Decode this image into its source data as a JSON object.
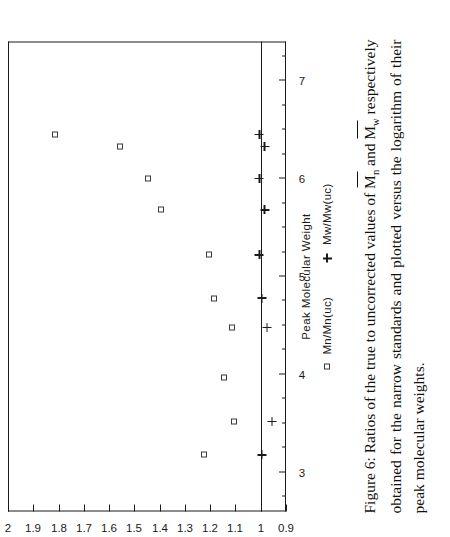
{
  "figure": {
    "caption_prefix": "Figure 6:",
    "caption_text": " Ratios of the true to uncorrected values of M̄n and M̄w respectively obtained for the narrow standards and plotted versus the logarithm of their peak molecular weights.",
    "caption_part1": " Ratios of the true to uncorrected values of ",
    "caption_m1_base": "M",
    "caption_m1_sub": "n",
    "caption_mid1": " and ",
    "caption_m2_base": "M",
    "caption_m2_sub": "w",
    "caption_part2": " respectively obtained for the narrow standards and plotted versus the logarithm of their peak molecular weights."
  },
  "chart_data": {
    "type": "scatter",
    "title": "",
    "xlabel": "Peak Molecular Weight",
    "ylabel": "",
    "xlim": [
      2.6,
      7.4
    ],
    "ylim": [
      0.9,
      2.0
    ],
    "grid": false,
    "legend_position": "below",
    "legend_title": "Peak Molecular Weight",
    "x_ticks_major": [
      3,
      4,
      5,
      6,
      7
    ],
    "x_ticks_major_labels": [
      "3",
      "4",
      "5",
      "6",
      "7"
    ],
    "x_ticks_minor": [
      2.75,
      3.25,
      3.5,
      3.75,
      4.25,
      4.5,
      4.75,
      5.25,
      5.5,
      5.75,
      6.25,
      6.5,
      6.75,
      7.25
    ],
    "y_ticks_major": [
      0.9,
      1,
      1.1,
      1.2,
      1.3,
      1.4,
      1.5,
      1.6,
      1.7,
      1.8,
      1.9,
      2
    ],
    "y_ticks_major_labels": [
      "0.9",
      "1",
      "1.1",
      "1.2",
      "1.3",
      "1.4",
      "1.5",
      "1.6",
      "1.7",
      "1.8",
      "1.9",
      "2"
    ],
    "reference_line_y": 1.0,
    "series": [
      {
        "name": "Mn/Mn(uc)",
        "marker": "square",
        "points": [
          {
            "x": 3.18,
            "y": 1.225
          },
          {
            "x": 3.52,
            "y": 1.105
          },
          {
            "x": 3.97,
            "y": 1.145
          },
          {
            "x": 4.48,
            "y": 1.115
          },
          {
            "x": 4.78,
            "y": 1.185
          },
          {
            "x": 5.22,
            "y": 1.205
          },
          {
            "x": 5.68,
            "y": 1.395
          },
          {
            "x": 6.0,
            "y": 1.445
          },
          {
            "x": 6.33,
            "y": 1.555
          },
          {
            "x": 6.45,
            "y": 1.815
          }
        ]
      },
      {
        "name": "Mw/Mw(uc)",
        "marker": "plus",
        "points": [
          {
            "x": 3.18,
            "y": 0.995
          },
          {
            "x": 3.52,
            "y": 0.955
          },
          {
            "x": 4.48,
            "y": 0.975
          },
          {
            "x": 4.78,
            "y": 0.995
          },
          {
            "x": 5.22,
            "y": 1.005
          },
          {
            "x": 5.68,
            "y": 0.985
          },
          {
            "x": 6.0,
            "y": 1.005
          },
          {
            "x": 6.33,
            "y": 0.985
          },
          {
            "x": 6.45,
            "y": 1.005
          }
        ]
      }
    ]
  },
  "legend": {
    "title": "Peak Molecular Weight",
    "items": [
      {
        "marker": "square",
        "label": "Mn/Mn(uc)"
      },
      {
        "marker": "plus",
        "label": "Mw/Mw(uc)"
      }
    ]
  },
  "colors": {
    "axis": "#1a1a1a",
    "marker_square": "#3a3a3a",
    "marker_plus": "#1a1a1a",
    "text": "#111111",
    "background": "#ffffff"
  }
}
